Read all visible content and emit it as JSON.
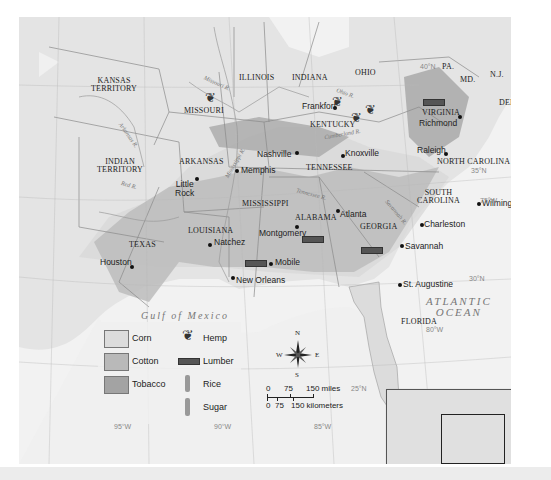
{
  "map": {
    "title": "Agriculture in the Antebellum South",
    "states": [
      "KANSAS TERRITORY",
      "MISSOURI",
      "ILLINOIS",
      "INDIANA",
      "OHIO",
      "PA.",
      "N.J.",
      "MD.",
      "DEL.",
      "KENTUCKY",
      "VIRGINIA",
      "INDIAN TERRITORY",
      "ARKANSAS",
      "TENNESSEE",
      "NORTH CAROLINA",
      "SOUTH CAROLINA",
      "MISSISSIPPI",
      "ALABAMA",
      "GEORGIA",
      "LOUISIANA",
      "TEXAS",
      "FLORIDA"
    ],
    "state_labels": {
      "kansas_1": "KANSAS",
      "kansas_2": "TERRITORY",
      "missouri": "MISSOURI",
      "illinois": "ILLINOIS",
      "indiana": "INDIANA",
      "ohio": "OHIO",
      "pa": "PA.",
      "nj": "N.J.",
      "md": "MD.",
      "del": "DEL.",
      "kentucky": "KENTUCKY",
      "virginia": "VIRGINIA",
      "indian_1": "INDIAN",
      "indian_2": "TERRITORY",
      "arkansas": "ARKANSAS",
      "tennessee": "TENNESSEE",
      "north_carolina": "NORTH CAROLINA",
      "south_carolina_1": "SOUTH",
      "south_carolina_2": "CAROLINA",
      "mississippi": "MISSISSIPPI",
      "alabama": "ALABAMA",
      "georgia": "GEORGIA",
      "louisiana": "LOUISIANA",
      "texas": "TEXAS",
      "florida": "FLORIDA"
    },
    "cities": {
      "frankfort": "Frankfort",
      "richmond": "Richmond",
      "nashville": "Nashville",
      "knoxville": "Knoxville",
      "raleigh": "Raleigh",
      "memphis": "Memphis",
      "little_rock_1": "Little",
      "little_rock_2": "Rock",
      "wilmington": "Wilmington",
      "atlanta": "Atlanta",
      "charleston": "Charleston",
      "montgomery": "Montgomery",
      "natchez": "Natchez",
      "savannah": "Savannah",
      "mobile": "Mobile",
      "houston": "Houston",
      "new_orleans": "New Orleans",
      "st_augustine": "St. Augustine"
    },
    "rivers": {
      "missouri": "Missouri R.",
      "ohio": "Ohio R.",
      "cumberland": "Cumberland R.",
      "arkansas": "Arkansas R.",
      "red": "Red R.",
      "mississippi": "Mississippi R.",
      "tennessee": "Tennessee R.",
      "savannah": "Savannah R."
    },
    "water": {
      "gulf": "Gulf of Mexico",
      "atlantic_1": "ATLANTIC",
      "atlantic_2": "OCEAN"
    },
    "coordinates": {
      "n40": "40°N",
      "n35": "35°N",
      "n30": "30°N",
      "n25": "25°N",
      "w75": "75°W",
      "w80": "80°W",
      "w85": "85°W",
      "w90": "90°W",
      "w95": "95°W"
    },
    "legend": {
      "items": [
        {
          "label": "Corn",
          "type": "area",
          "color": "#dcdcdc"
        },
        {
          "label": "Cotton",
          "type": "area",
          "color": "#b9b9b9"
        },
        {
          "label": "Tobacco",
          "type": "area",
          "color": "#a3a3a3"
        },
        {
          "label": "Hemp",
          "type": "symbol",
          "icon": "hemp-icon"
        },
        {
          "label": "Lumber",
          "type": "symbol",
          "icon": "lumber-icon"
        },
        {
          "label": "Rice",
          "type": "symbol",
          "icon": "rice-icon"
        },
        {
          "label": "Sugar",
          "type": "symbol",
          "icon": "sugar-icon"
        }
      ]
    },
    "compass": {
      "n": "N",
      "s": "S",
      "e": "E",
      "w": "W"
    },
    "scale": {
      "miles_0": "0",
      "miles_75": "75",
      "miles_150": "150 miles",
      "km_0": "0",
      "km_75": "75",
      "km_150": "150 kilometers"
    }
  }
}
